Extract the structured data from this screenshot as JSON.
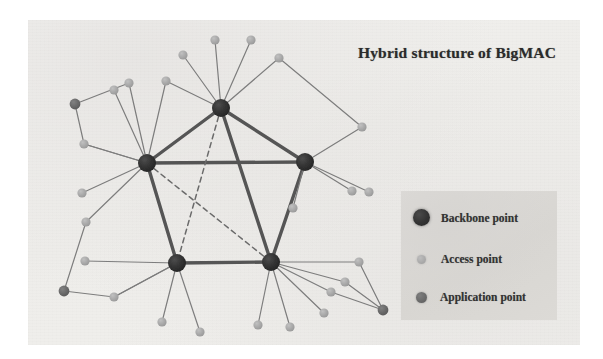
{
  "figure": {
    "title": "Hybrid structure of BigMAC",
    "background_color": "#f1f0ed",
    "page_color": "#ffffff"
  },
  "legend": {
    "box_color": "#dad8d4",
    "items": [
      {
        "id": "backbone",
        "label": "Backbone point",
        "color": "#333333",
        "marker": "large-dark-circle",
        "radius": 8.5
      },
      {
        "id": "access",
        "label": "Access point",
        "color": "#a9a9a9",
        "marker": "small-light-circle",
        "radius": 4.5
      },
      {
        "id": "application",
        "label": "Application point",
        "color": "#696969",
        "marker": "medium-gray-circle",
        "radius": 5.5
      }
    ]
  },
  "chart_data": {
    "type": "scatter",
    "title": "Hybrid structure of BigMAC",
    "xlabel": "",
    "ylabel": "",
    "node_types": {
      "backbone": {
        "color": "#333333",
        "radius": 9
      },
      "access": {
        "color": "#a9a9a9",
        "radius": 4.6
      },
      "application": {
        "color": "#696969",
        "radius": 5.4
      }
    },
    "edge_styles": {
      "trunk": {
        "color": "#555555",
        "width": 3.4,
        "dash": "none"
      },
      "dashed": {
        "color": "#6b6b6b",
        "width": 1.5,
        "dash": "5,4"
      },
      "access": {
        "color": "#7d7d7d",
        "width": 1.2,
        "dash": "none"
      }
    },
    "nodes": [
      {
        "id": "B1",
        "type": "backbone",
        "x": 221,
        "y": 108
      },
      {
        "id": "B2",
        "type": "backbone",
        "x": 147,
        "y": 163
      },
      {
        "id": "B3",
        "type": "backbone",
        "x": 305,
        "y": 162
      },
      {
        "id": "B4",
        "type": "backbone",
        "x": 177,
        "y": 263
      },
      {
        "id": "B5",
        "type": "backbone",
        "x": 271,
        "y": 262
      },
      {
        "id": "A1",
        "type": "access",
        "x": 215,
        "y": 40
      },
      {
        "id": "A2",
        "type": "access",
        "x": 251,
        "y": 40
      },
      {
        "id": "A3",
        "type": "access",
        "x": 183,
        "y": 55
      },
      {
        "id": "A4",
        "type": "access",
        "x": 279,
        "y": 58
      },
      {
        "id": "A5",
        "type": "access",
        "x": 129,
        "y": 83
      },
      {
        "id": "A6",
        "type": "access",
        "x": 166,
        "y": 81
      },
      {
        "id": "A7",
        "type": "access",
        "x": 114,
        "y": 90
      },
      {
        "id": "A8",
        "type": "access",
        "x": 84,
        "y": 144
      },
      {
        "id": "A9",
        "type": "access",
        "x": 82,
        "y": 193
      },
      {
        "id": "A10",
        "type": "access",
        "x": 86,
        "y": 222
      },
      {
        "id": "A11",
        "type": "access",
        "x": 85,
        "y": 261
      },
      {
        "id": "A12",
        "type": "access",
        "x": 114,
        "y": 297
      },
      {
        "id": "A13",
        "type": "access",
        "x": 362,
        "y": 127
      },
      {
        "id": "A14",
        "type": "access",
        "x": 369,
        "y": 192
      },
      {
        "id": "A15",
        "type": "access",
        "x": 293,
        "y": 208
      },
      {
        "id": "A16",
        "type": "access",
        "x": 352,
        "y": 191
      },
      {
        "id": "A17",
        "type": "access",
        "x": 162,
        "y": 322
      },
      {
        "id": "A18",
        "type": "access",
        "x": 200,
        "y": 332
      },
      {
        "id": "A19",
        "type": "access",
        "x": 258,
        "y": 325
      },
      {
        "id": "A20",
        "type": "access",
        "x": 290,
        "y": 327
      },
      {
        "id": "A21",
        "type": "access",
        "x": 331,
        "y": 292
      },
      {
        "id": "A22",
        "type": "access",
        "x": 345,
        "y": 282
      },
      {
        "id": "A23",
        "type": "access",
        "x": 359,
        "y": 262
      },
      {
        "id": "A24",
        "type": "access",
        "x": 324,
        "y": 313
      },
      {
        "id": "P1",
        "type": "application",
        "x": 75,
        "y": 104
      },
      {
        "id": "P2",
        "type": "application",
        "x": 64,
        "y": 291
      },
      {
        "id": "P3",
        "type": "application",
        "x": 383,
        "y": 310
      }
    ],
    "edges": [
      {
        "from": "B1",
        "to": "B2",
        "style": "trunk"
      },
      {
        "from": "B1",
        "to": "B3",
        "style": "trunk"
      },
      {
        "from": "B2",
        "to": "B3",
        "style": "trunk"
      },
      {
        "from": "B2",
        "to": "B4",
        "style": "trunk"
      },
      {
        "from": "B3",
        "to": "B5",
        "style": "trunk"
      },
      {
        "from": "B4",
        "to": "B5",
        "style": "trunk"
      },
      {
        "from": "B1",
        "to": "B5",
        "style": "trunk"
      },
      {
        "from": "B1",
        "to": "B4",
        "style": "dashed"
      },
      {
        "from": "B2",
        "to": "B5",
        "style": "dashed"
      },
      {
        "from": "B1",
        "to": "A1",
        "style": "access"
      },
      {
        "from": "B1",
        "to": "A2",
        "style": "access"
      },
      {
        "from": "B1",
        "to": "A3",
        "style": "access"
      },
      {
        "from": "B1",
        "to": "A4",
        "style": "access"
      },
      {
        "from": "B1",
        "to": "A6",
        "style": "access"
      },
      {
        "from": "A4",
        "to": "A13",
        "style": "access"
      },
      {
        "from": "A13",
        "to": "B3",
        "style": "access"
      },
      {
        "from": "B2",
        "to": "A5",
        "style": "access"
      },
      {
        "from": "B2",
        "to": "A6",
        "style": "access"
      },
      {
        "from": "B2",
        "to": "A7",
        "style": "access"
      },
      {
        "from": "B2",
        "to": "A8",
        "style": "access"
      },
      {
        "from": "B2",
        "to": "A9",
        "style": "access"
      },
      {
        "from": "B2",
        "to": "A10",
        "style": "access"
      },
      {
        "from": "P1",
        "to": "A5",
        "style": "access"
      },
      {
        "from": "P1",
        "to": "A8",
        "style": "access"
      },
      {
        "from": "A8",
        "to": "B2",
        "style": "access"
      },
      {
        "from": "B3",
        "to": "A14",
        "style": "access"
      },
      {
        "from": "B3",
        "to": "A15",
        "style": "access"
      },
      {
        "from": "B3",
        "to": "A16",
        "style": "access"
      },
      {
        "from": "B4",
        "to": "A11",
        "style": "access"
      },
      {
        "from": "B4",
        "to": "A12",
        "style": "access"
      },
      {
        "from": "B4",
        "to": "A17",
        "style": "access"
      },
      {
        "from": "B4",
        "to": "A18",
        "style": "access"
      },
      {
        "from": "A10",
        "to": "P2",
        "style": "access"
      },
      {
        "from": "P2",
        "to": "A12",
        "style": "access"
      },
      {
        "from": "A12",
        "to": "B4",
        "style": "access"
      },
      {
        "from": "B5",
        "to": "A19",
        "style": "access"
      },
      {
        "from": "B5",
        "to": "A20",
        "style": "access"
      },
      {
        "from": "B5",
        "to": "A21",
        "style": "access"
      },
      {
        "from": "B5",
        "to": "A22",
        "style": "access"
      },
      {
        "from": "B5",
        "to": "A23",
        "style": "access"
      },
      {
        "from": "B5",
        "to": "A24",
        "style": "access"
      },
      {
        "from": "A23",
        "to": "P3",
        "style": "access"
      },
      {
        "from": "A22",
        "to": "P3",
        "style": "access"
      },
      {
        "from": "A21",
        "to": "P3",
        "style": "access"
      }
    ]
  }
}
